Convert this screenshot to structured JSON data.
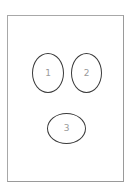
{
  "diagram": {
    "frame": {
      "shape": "rectangle",
      "border_color": "#a8a8a8"
    },
    "nodes": [
      {
        "id": 1,
        "label": "1",
        "shape": "ellipse",
        "orientation": "vertical"
      },
      {
        "id": 2,
        "label": "2",
        "shape": "ellipse",
        "orientation": "vertical"
      },
      {
        "id": 3,
        "label": "3",
        "shape": "ellipse",
        "orientation": "horizontal"
      }
    ],
    "colors": {
      "stroke": "#3a3a3a",
      "label": "#9a9a9a",
      "background": "#ffffff"
    }
  }
}
